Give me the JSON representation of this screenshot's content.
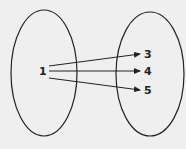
{
  "diagram": {
    "type": "mapping",
    "domain": {
      "elements": [
        "1"
      ]
    },
    "range": {
      "elements": [
        "3",
        "4",
        "5"
      ]
    },
    "mappings": [
      {
        "from": "1",
        "to": "3"
      },
      {
        "from": "1",
        "to": "4"
      },
      {
        "from": "1",
        "to": "5"
      }
    ],
    "colors": {
      "stroke": "#222222",
      "background": "#efefef"
    }
  }
}
